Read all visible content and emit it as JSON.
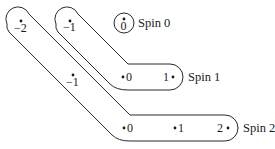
{
  "diagram": {
    "groups": [
      {
        "label": "Spin 0",
        "states": [
          {
            "value": "0",
            "display": "0"
          }
        ]
      },
      {
        "label": "Spin 1",
        "states": [
          {
            "value": "-1",
            "display": "−1"
          },
          {
            "value": "0",
            "display": "0"
          },
          {
            "value": "1",
            "display": "1"
          }
        ]
      },
      {
        "label": "Spin 2",
        "states": [
          {
            "value": "-2",
            "display": "−2"
          },
          {
            "value": "-1",
            "display": "−1"
          },
          {
            "value": "0",
            "display": "0"
          },
          {
            "value": "1",
            "display": "1"
          },
          {
            "value": "2",
            "display": "2"
          }
        ]
      }
    ],
    "colors": {
      "stroke": "#2a2a2a",
      "text": "#1a1a1a",
      "background": "#ffffff"
    }
  }
}
